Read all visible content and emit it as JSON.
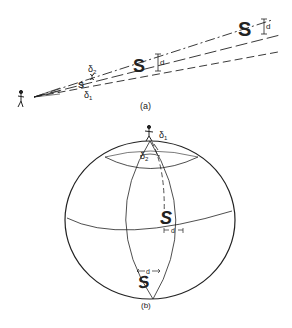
{
  "figure": {
    "panel_a": {
      "caption": "(a)",
      "labels": {
        "delta1": "δ",
        "delta1_sub": "1",
        "delta2": "δ",
        "delta2_sub": "2",
        "d_mid": "d",
        "d_far": "d"
      },
      "letters": {
        "near": "S",
        "mid": "S",
        "far": "S"
      }
    },
    "panel_b": {
      "caption": "(b)",
      "labels": {
        "delta1": "δ",
        "delta1_sub": "1",
        "delta2": "δ",
        "delta2_sub": "2",
        "d_equator": "d",
        "d_bottom": "d"
      },
      "letters": {
        "equator": "S",
        "bottom": "S"
      }
    },
    "colors": {
      "ink": "#222222",
      "background": "#ffffff"
    }
  }
}
